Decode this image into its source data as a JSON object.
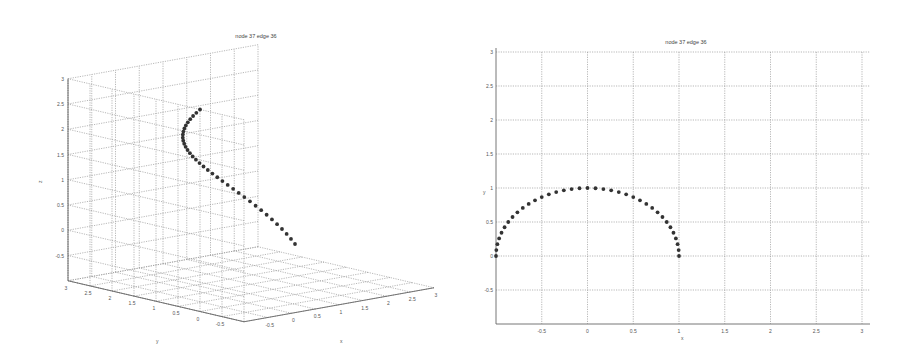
{
  "chart_data": [
    {
      "type": "scatter",
      "subtype": "3d-line-markers",
      "title": "node 37 edge 36",
      "xlabel": "x",
      "ylabel": "y",
      "zlabel": "z",
      "xlim": [
        -1,
        3
      ],
      "ylim": [
        -1,
        3
      ],
      "zlim": [
        -1,
        3
      ],
      "xticks": [
        "-0.5",
        "0",
        "0.5",
        "1",
        "1.5",
        "2",
        "2.5",
        "3"
      ],
      "yticks": [
        "3",
        "2.5",
        "2",
        "1.5",
        "1",
        "0.5",
        "0",
        "-0.5"
      ],
      "zticks": [
        "3",
        "2.5",
        "2",
        "1.5",
        "1",
        "0.5",
        "0",
        "-0.5"
      ],
      "grid": true,
      "legend": null,
      "nodes": 37,
      "curve": "x=cos(t), y=sin(t), z≈3t/π, t∈[0,π]"
    },
    {
      "type": "scatter",
      "subtype": "2d-line-markers",
      "title": "node 37 edge 36",
      "xlabel": "x",
      "ylabel": "y",
      "xlim": [
        -1,
        3
      ],
      "ylim": [
        -1,
        3
      ],
      "xticks": [
        "-0.5",
        "0",
        "0.5",
        "1",
        "1.5",
        "2",
        "2.5",
        "3"
      ],
      "yticks": [
        "3",
        "2.5",
        "2",
        "1.5",
        "1",
        "0.5",
        "0",
        "-0.5"
      ],
      "grid": true,
      "legend": null,
      "nodes": 37,
      "curve": "semicircle x=cos(t), y=sin(t), t∈[0,π]"
    }
  ],
  "plot3d": {
    "title": "node 37 edge 36",
    "zlabel": "z",
    "xlabel": "x",
    "ylabel": "y"
  },
  "plot2d": {
    "title": "node 37 edge 36",
    "xlabel": "x",
    "ylabel": "y"
  }
}
